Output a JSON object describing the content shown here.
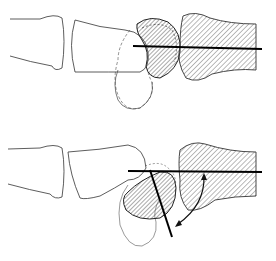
{
  "figure": {
    "type": "anatomical-line-drawing",
    "panels": [
      {
        "id": "top",
        "description": "Normal alignment: lunate hatched with axis line collinear with radius axis"
      },
      {
        "id": "bottom",
        "description": "Tilted alignment: angle between lunate axis and radius axis indicated by curved double arrow"
      }
    ],
    "colors": {
      "stroke": "#222222",
      "line": "#000000",
      "hatch": "#555555",
      "background": "#ffffff"
    }
  }
}
